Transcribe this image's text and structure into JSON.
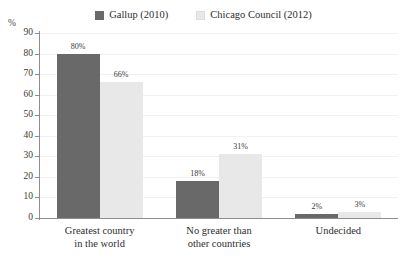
{
  "chart_data": {
    "type": "bar",
    "title": "",
    "subtitle": "",
    "xlabel": "",
    "ylabel": "%",
    "ylim": [
      0,
      90
    ],
    "yticks": [
      0,
      10,
      20,
      30,
      40,
      50,
      60,
      70,
      80,
      90
    ],
    "grid": true,
    "legend_position": "top-center",
    "categories": [
      "Greatest country in the world",
      "No greater than other countries",
      "Undecided"
    ],
    "category_lines": [
      [
        "Greatest country",
        "in the world"
      ],
      [
        "No greater than",
        "other countries"
      ],
      [
        "Undecided"
      ]
    ],
    "series": [
      {
        "name": "Gallup (2010)",
        "color": "#696969",
        "values": [
          80,
          18,
          2
        ],
        "value_labels": [
          "80%",
          "18%",
          "2%"
        ]
      },
      {
        "name": "Chicago Council (2012)",
        "color": "#e8e8e8",
        "values": [
          66,
          31,
          3
        ],
        "value_labels": [
          "66%",
          "31%",
          "3%"
        ]
      }
    ]
  },
  "legend": {
    "entries": [
      {
        "label": "Gallup (2010)",
        "color": "#696969"
      },
      {
        "label": "Chicago Council (2012)",
        "color": "#e8e8e8"
      }
    ]
  },
  "axis": {
    "percent_caption": "%",
    "ytick_labels": [
      "90",
      "80",
      "70",
      "60",
      "50",
      "40",
      "30",
      "20",
      "10",
      "0"
    ]
  },
  "colors": {
    "series_1": "#696969",
    "series_2": "#e8e8e8",
    "axis_line": "#8d8d8d",
    "gridline": "#f1f1f1",
    "text": "#2e2e2e",
    "background": "#ffffff"
  }
}
